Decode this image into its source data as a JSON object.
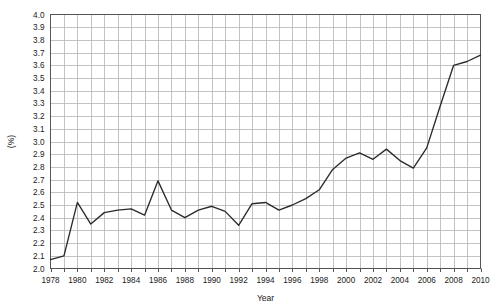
{
  "chart_data": {
    "type": "line",
    "title": "",
    "subtitle": "",
    "xlabel": "Year",
    "ylabel": "(%)",
    "xlim": [
      1978,
      2010
    ],
    "ylim": [
      2.0,
      4.0
    ],
    "ytick_step": 0.1,
    "xtick_step": 1,
    "xtick_label_step": 2,
    "grid": true,
    "legend": null,
    "legend_position": "none",
    "line_color": "#2b2b2b",
    "grid_color": "#b4b4b4",
    "axis_color": "#555555",
    "background_color": "#ffffff",
    "markers": false,
    "x": [
      1978,
      1979,
      1980,
      1981,
      1982,
      1983,
      1984,
      1985,
      1986,
      1987,
      1988,
      1989,
      1990,
      1991,
      1992,
      1993,
      1994,
      1995,
      1996,
      1997,
      1998,
      1999,
      2000,
      2001,
      2002,
      2003,
      2004,
      2005,
      2006,
      2007,
      2008,
      2009,
      2010
    ],
    "values": [
      2.07,
      2.1,
      2.52,
      2.35,
      2.44,
      2.46,
      2.47,
      2.42,
      2.69,
      2.46,
      2.4,
      2.46,
      2.49,
      2.45,
      2.34,
      2.51,
      2.52,
      2.46,
      2.5,
      2.55,
      2.62,
      2.78,
      2.87,
      2.91,
      2.86,
      2.94,
      2.85,
      2.79,
      2.95,
      3.28,
      3.6,
      3.63,
      3.68
    ],
    "xtick_labels": [
      "1978",
      "1980",
      "1982",
      "1984",
      "1986",
      "1988",
      "1990",
      "1992",
      "1994",
      "1996",
      "1998",
      "2000",
      "2002",
      "2004",
      "2006",
      "2008",
      "2010"
    ],
    "ytick_labels": [
      "2.0",
      "2.1",
      "2.2",
      "2.3",
      "2.4",
      "2.5",
      "2.6",
      "2.7",
      "2.8",
      "2.9",
      "3.0",
      "3.1",
      "3.2",
      "3.3",
      "3.4",
      "3.5",
      "3.6",
      "3.7",
      "3.8",
      "3.9",
      "4.0"
    ]
  }
}
